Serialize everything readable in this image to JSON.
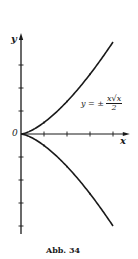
{
  "figure": {
    "caption": "Abb. 34",
    "axis_x_label": "x",
    "axis_y_label": "y",
    "origin_label": "0",
    "equation": {
      "lhs": "y = ±",
      "numerator": "x√x",
      "denominator": "2"
    }
  },
  "chart_data": {
    "type": "line",
    "title": "",
    "caption": "Abb. 34",
    "xlabel": "x",
    "ylabel": "y",
    "annotation": "y = ± x√x / 2",
    "xlim": [
      0,
      4.6
    ],
    "ylim": [
      -4,
      4.3
    ],
    "x_ticks": [
      1,
      2,
      3,
      4
    ],
    "y_ticks": [
      -4,
      -3,
      -2,
      -1,
      1,
      2,
      3
    ],
    "grid": false,
    "legend": "none",
    "series": [
      {
        "name": "y = + x√x/2",
        "x": [
          0,
          0.5,
          1,
          1.5,
          2,
          2.5,
          3,
          3.5,
          4
        ],
        "y": [
          0,
          0.18,
          0.5,
          0.92,
          1.41,
          1.98,
          2.6,
          3.27,
          4.0
        ]
      },
      {
        "name": "y = - x√x/2",
        "x": [
          0,
          0.5,
          1,
          1.5,
          2,
          2.5,
          3,
          3.5,
          4
        ],
        "y": [
          0,
          -0.18,
          -0.5,
          -0.92,
          -1.41,
          -1.98,
          -2.6,
          -3.27,
          -4.0
        ]
      }
    ],
    "colors": {
      "ink": "#1a1a1a",
      "background": "#ffffff"
    }
  }
}
